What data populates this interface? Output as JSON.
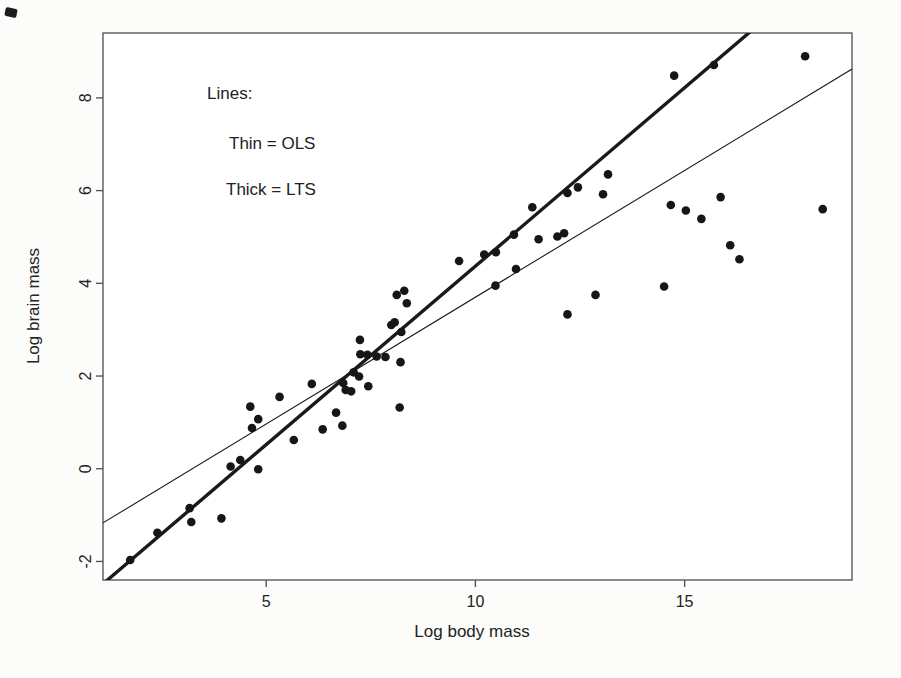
{
  "figure": {
    "background": "#fcfcfa",
    "plot_background": "#ffffff",
    "axis_color": "#4d4d4d",
    "point_color": "#161616",
    "line_color": "#1a1a1a"
  },
  "annotations": {
    "legend_title": "Lines:",
    "thin_line_label": "Thin = OLS",
    "thick_line_label": "Thick = LTS"
  },
  "chart_data": {
    "type": "scatter",
    "title": "",
    "xlabel": "Log body mass",
    "ylabel": "Log brain mass",
    "xlim": [
      1.1,
      19.0
    ],
    "ylim": [
      -2.4,
      9.4
    ],
    "x_ticks": [
      5,
      10,
      15
    ],
    "y_ticks": [
      -2,
      0,
      2,
      4,
      6,
      8
    ],
    "grid": false,
    "legend_position": "top-left-inside-as-text",
    "points": [
      [
        1.75,
        -1.97
      ],
      [
        2.4,
        -1.38
      ],
      [
        3.21,
        -1.15
      ],
      [
        3.17,
        -0.85
      ],
      [
        3.93,
        -1.07
      ],
      [
        4.15,
        0.05
      ],
      [
        4.38,
        0.19
      ],
      [
        4.81,
        -0.01
      ],
      [
        4.62,
        1.34
      ],
      [
        4.81,
        1.07
      ],
      [
        4.66,
        0.88
      ],
      [
        5.32,
        1.55
      ],
      [
        5.66,
        0.62
      ],
      [
        6.09,
        1.83
      ],
      [
        6.35,
        0.85
      ],
      [
        6.67,
        1.21
      ],
      [
        6.82,
        0.93
      ],
      [
        6.84,
        1.85
      ],
      [
        6.9,
        1.7
      ],
      [
        7.03,
        1.67
      ],
      [
        7.09,
        2.08
      ],
      [
        7.22,
        1.99
      ],
      [
        7.24,
        2.78
      ],
      [
        7.25,
        2.47
      ],
      [
        7.42,
        2.46
      ],
      [
        7.64,
        2.42
      ],
      [
        7.85,
        2.41
      ],
      [
        7.44,
        1.78
      ],
      [
        8.19,
        1.32
      ],
      [
        8.21,
        2.3
      ],
      [
        7.99,
        3.1
      ],
      [
        8.07,
        3.16
      ],
      [
        8.23,
        2.95
      ],
      [
        8.12,
        3.75
      ],
      [
        8.3,
        3.84
      ],
      [
        8.36,
        3.57
      ],
      [
        9.61,
        4.48
      ],
      [
        10.21,
        4.62
      ],
      [
        10.49,
        4.67
      ],
      [
        10.48,
        3.95
      ],
      [
        10.92,
        5.05
      ],
      [
        10.97,
        4.31
      ],
      [
        11.36,
        5.64
      ],
      [
        11.51,
        4.95
      ],
      [
        11.96,
        5.01
      ],
      [
        12.12,
        5.08
      ],
      [
        12.2,
        5.95
      ],
      [
        12.45,
        6.07
      ],
      [
        12.2,
        3.33
      ],
      [
        12.87,
        3.75
      ],
      [
        13.05,
        5.92
      ],
      [
        13.17,
        6.35
      ],
      [
        14.51,
        3.93
      ],
      [
        14.67,
        5.69
      ],
      [
        15.03,
        5.57
      ],
      [
        15.4,
        5.39
      ],
      [
        15.86,
        5.86
      ],
      [
        16.09,
        4.82
      ],
      [
        16.31,
        4.52
      ],
      [
        18.3,
        5.6
      ],
      [
        14.75,
        8.48
      ],
      [
        15.7,
        8.71
      ],
      [
        17.88,
        8.9
      ]
    ],
    "lines": [
      {
        "name": "OLS",
        "style": "thin",
        "slope": 0.547,
        "intercept": -1.77
      },
      {
        "name": "LTS",
        "style": "thick",
        "slope": 0.77,
        "intercept": -3.33
      }
    ]
  }
}
